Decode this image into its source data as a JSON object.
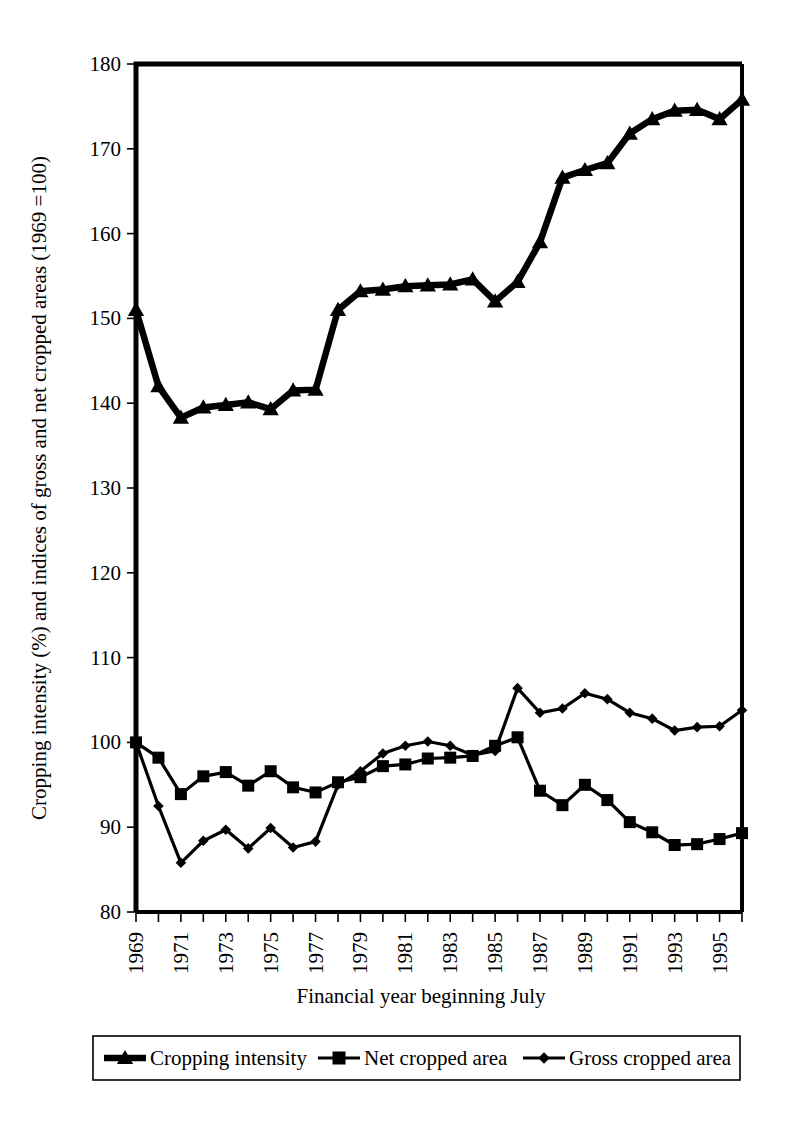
{
  "chart_data": {
    "type": "line",
    "title": "",
    "xlabel": "Financial year beginning July",
    "ylabel": "Cropping intensity (%) and indices of gross and net cropped areas (1969 =100)",
    "xlim": [
      1969,
      1996
    ],
    "ylim": [
      80,
      180
    ],
    "ytick_values": [
      80,
      90,
      100,
      110,
      120,
      130,
      140,
      150,
      160,
      170,
      180
    ],
    "ytick_labels": [
      "80",
      "90",
      "100",
      "110",
      "120",
      "130",
      "140",
      "150",
      "160",
      "170",
      "180"
    ],
    "xtick_values": [
      1969,
      1970,
      1971,
      1972,
      1973,
      1974,
      1975,
      1976,
      1977,
      1978,
      1979,
      1980,
      1981,
      1982,
      1983,
      1984,
      1985,
      1986,
      1987,
      1988,
      1989,
      1990,
      1991,
      1992,
      1993,
      1994,
      1995,
      1996
    ],
    "xtick_labels": [
      "1969",
      "",
      "1971",
      "",
      "1973",
      "",
      "1975",
      "",
      "1977",
      "",
      "1979",
      "",
      "1981",
      "",
      "1983",
      "",
      "1985",
      "",
      "1987",
      "",
      "1989",
      "",
      "1991",
      "",
      "1993",
      "",
      "1995",
      ""
    ],
    "grid": false,
    "legend_position": "bottom",
    "x": [
      1969,
      1970,
      1971,
      1972,
      1973,
      1974,
      1975,
      1976,
      1977,
      1978,
      1979,
      1980,
      1981,
      1982,
      1983,
      1984,
      1985,
      1986,
      1987,
      1988,
      1989,
      1990,
      1991,
      1992,
      1993,
      1994,
      1995,
      1996
    ],
    "series": [
      {
        "name": "Cropping intensity",
        "marker": "triangle",
        "color": "#000000",
        "values": [
          151.0,
          142.0,
          138.3,
          139.5,
          139.8,
          140.1,
          139.3,
          141.5,
          141.6,
          151.0,
          153.2,
          153.4,
          153.8,
          153.9,
          154.0,
          154.6,
          152.0,
          154.3,
          159.0,
          166.6,
          167.5,
          168.3,
          171.8,
          173.5,
          174.5,
          174.6,
          173.5,
          175.8
        ]
      },
      {
        "name": "Net cropped area",
        "marker": "square",
        "color": "#000000",
        "values": [
          100.0,
          98.2,
          93.9,
          96.0,
          96.5,
          94.9,
          96.6,
          94.7,
          94.1,
          95.3,
          95.9,
          97.2,
          97.4,
          98.1,
          98.2,
          98.4,
          99.6,
          100.6,
          94.3,
          92.6,
          95.0,
          93.2,
          90.6,
          89.4,
          87.9,
          88.0,
          88.6,
          89.3
        ]
      },
      {
        "name": "Gross cropped area",
        "marker": "diamond",
        "color": "#000000",
        "values": [
          100.0,
          92.5,
          85.8,
          88.4,
          89.7,
          87.5,
          89.9,
          87.6,
          88.3,
          95.0,
          96.6,
          98.7,
          99.6,
          100.1,
          99.6,
          98.5,
          99.0,
          106.4,
          103.5,
          104.0,
          105.8,
          105.1,
          103.5,
          102.8,
          101.4,
          101.8,
          101.9,
          103.8
        ]
      }
    ]
  },
  "legend": {
    "items": [
      {
        "label": "Cropping intensity",
        "marker": "triangle"
      },
      {
        "label": "Net cropped area",
        "marker": "square"
      },
      {
        "label": "Gross cropped area",
        "marker": "diamond"
      }
    ]
  }
}
